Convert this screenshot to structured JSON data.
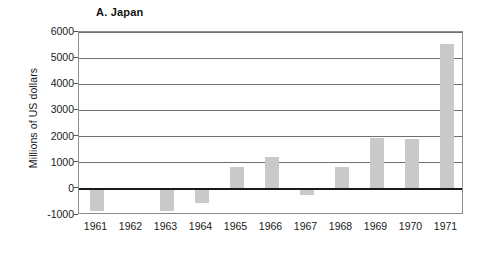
{
  "chart_data": {
    "type": "bar",
    "title": "A. Japan",
    "xlabel": "",
    "ylabel": "Millions of US dollars",
    "categories": [
      "1961",
      "1962",
      "1963",
      "1964",
      "1965",
      "1966",
      "1967",
      "1968",
      "1969",
      "1970",
      "1971"
    ],
    "values": [
      -850,
      0,
      -850,
      -550,
      850,
      1200,
      -250,
      850,
      1950,
      1900,
      5550
    ],
    "ylim": [
      -1000,
      6000
    ],
    "ytick_values": [
      6000,
      5000,
      4000,
      3000,
      2000,
      1000,
      0,
      -1000
    ],
    "ytick_labels": [
      "6000",
      "5000",
      "4000",
      "3000",
      "2000",
      "1000",
      "0",
      "-1000"
    ],
    "grid": true,
    "gridlines_at": [
      6000,
      5000,
      4000,
      3000,
      2000,
      1000,
      -1000
    ],
    "zero_line": 0,
    "legend": null,
    "legend_position": "none",
    "bar_color": "#c9c9c9",
    "axis_color": "#6f6f6f",
    "zero_line_color": "#1a1a1a",
    "series": [
      {
        "name": "Japan",
        "values": [
          -850,
          0,
          -850,
          -550,
          850,
          1200,
          -250,
          850,
          1950,
          1900,
          5550
        ]
      }
    ]
  }
}
